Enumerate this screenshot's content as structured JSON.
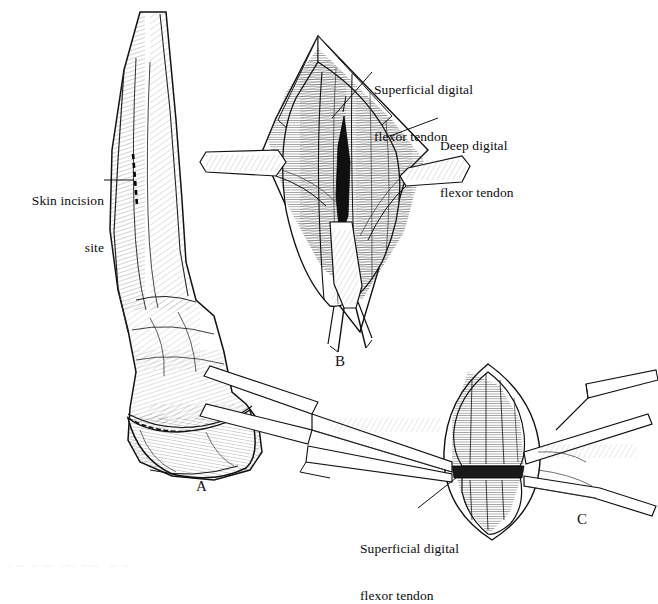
{
  "figure": {
    "background_color": "#ffffff",
    "ink_color": "#111111"
  },
  "labels": [
    {
      "id": "skin-incision",
      "line1": "Skin incision",
      "line2": "site",
      "align": "right",
      "x": 18,
      "y": 168
    },
    {
      "id": "superficial-digital-flexor-tendon-b",
      "line1": "Superficial digital",
      "line2": "flexor tendon",
      "align": "left",
      "x": 374,
      "y": 57
    },
    {
      "id": "deep-digital-flexor-tendon",
      "line1": "Deep digital",
      "line2": "flexor tendon",
      "align": "left",
      "x": 440,
      "y": 113
    },
    {
      "id": "superficial-digital-flexor-tendon-c",
      "line1": "Superficial digital",
      "line2": "flexor tendon",
      "align": "left",
      "x": 362,
      "y": 516
    }
  ],
  "panels": [
    {
      "id": "panel-a",
      "letter": "A",
      "x": 196,
      "y": 478,
      "description": "Lateral view of equine distal limb showing skin incision site"
    },
    {
      "id": "panel-b",
      "letter": "B",
      "x": 335,
      "y": 353,
      "description": "Incised tendon sheath with superficial and deep digital flexor tendons exposed, scissors in field"
    },
    {
      "id": "panel-c",
      "letter": "C",
      "x": 577,
      "y": 511,
      "description": "Transected superficial digital flexor tendon retracted with forceps"
    }
  ],
  "ghost_caption": "•  •••   ••  •••    ••• •  •• •••     ••   ••"
}
